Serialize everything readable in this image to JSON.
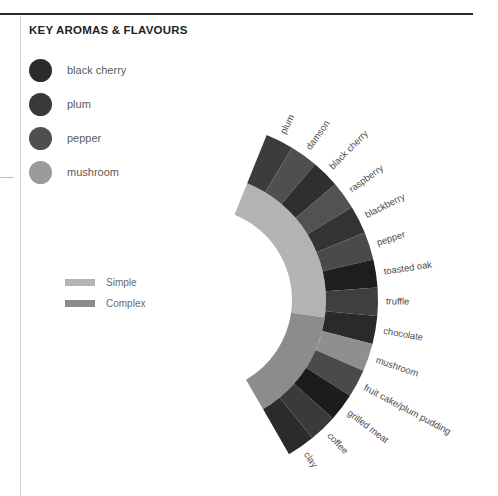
{
  "panel": {
    "title": "KEY AROMAS & FLAVOURS"
  },
  "legend": {
    "items": [
      {
        "label": "black cherry",
        "color": "#2b2b2b"
      },
      {
        "label": "plum",
        "color": "#393939"
      },
      {
        "label": "pepper",
        "color": "#4f4f4f"
      },
      {
        "label": "mushroom",
        "color": "#9a9a9a"
      }
    ]
  },
  "scale_legend": {
    "items": [
      {
        "label": "Simple",
        "color": "#b3b3b3"
      },
      {
        "label": "Complex",
        "color": "#8c8c8c"
      }
    ]
  },
  "chart_data": {
    "type": "pie",
    "title": "KEY AROMAS & FLAVOURS",
    "subtype": "fan / radial wedge diagram",
    "legend_position": "top-left",
    "grid": false,
    "center": {
      "x": 200,
      "y": 300
    },
    "inner_radius": 118,
    "outer_radius": 178,
    "gap_radius": 126,
    "arc_start_deg": -68,
    "arc_end_deg": 60,
    "categories": [
      "plum",
      "damson",
      "black cherry",
      "raspberry",
      "blackberry",
      "pepper",
      "toasted oak",
      "truffle",
      "chocolate",
      "mushroom",
      "fruit cake/plum pudding",
      "grilled meat",
      "coffee",
      "clay"
    ],
    "values": [
      1,
      1,
      1,
      1,
      1,
      1,
      1,
      1,
      1,
      1,
      1,
      1,
      1,
      1
    ],
    "colors": [
      "#3c3c3c",
      "#4f4f4f",
      "#2f2f2f",
      "#525252",
      "#333333",
      "#4a4a4a",
      "#1e1e1e",
      "#3f3f3f",
      "#2a2a2a",
      "#8f8f8f",
      "#4a4a4a",
      "#1c1c1c",
      "#3a3a3a",
      "#2b2b2b"
    ],
    "inner_band": {
      "name": "complexity scale",
      "segments": [
        {
          "label": "Simple",
          "color": "#b3b3b3",
          "start_deg": -68,
          "end_deg": 8
        },
        {
          "label": "Complex",
          "color": "#8c8c8c",
          "start_deg": 8,
          "end_deg": 60
        }
      ],
      "inner_radius": 92,
      "outer_radius": 126
    },
    "xlabel": "",
    "ylabel": ""
  }
}
